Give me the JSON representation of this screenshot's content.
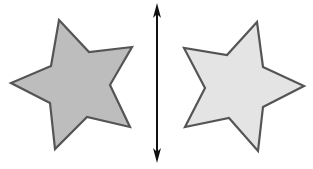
{
  "diagram": {
    "colors": {
      "background": "#ffffff",
      "left_star_fill": "#bdbdbd",
      "right_star_fill": "#e4e4e4",
      "star_stroke": "#555555",
      "arrow": "#111111"
    },
    "left_star": {
      "label": "original star",
      "points": "59,20 89,52 132,47 110,85 130,127 87,117 55,149 50,103 11,83 51,66"
    },
    "right_star": {
      "label": "reflected star",
      "points": "257,22 263,67 304,86 263,107 258,151 229,118 185,127 205,88 184,48 227,55"
    },
    "mirror_line": {
      "label": "line of reflection (double-headed arrow)",
      "x": 157,
      "y1": 3,
      "y2": 163
    }
  }
}
